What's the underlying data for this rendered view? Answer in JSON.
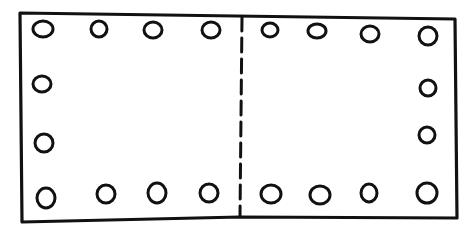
{
  "diagram": {
    "title": "",
    "stroke_color": "#111111",
    "background_color": "#ffffff",
    "outline": {
      "points": [
        [
          20,
          13
        ],
        [
          236,
          16
        ],
        [
          455,
          19
        ],
        [
          457,
          218
        ],
        [
          240,
          217
        ],
        [
          22,
          222
        ]
      ]
    },
    "fold_line": {
      "style": "dashed",
      "x1": 242,
      "y1": 17,
      "x2": 240,
      "y2": 216
    },
    "holes": [
      {
        "id": "top-1",
        "cx": 43,
        "cy": 29,
        "rx": 10,
        "ry": 8
      },
      {
        "id": "top-2",
        "cx": 99,
        "cy": 29,
        "rx": 8,
        "ry": 8
      },
      {
        "id": "top-3",
        "cx": 153,
        "cy": 30,
        "rx": 9,
        "ry": 8
      },
      {
        "id": "top-4",
        "cx": 211,
        "cy": 30,
        "rx": 9,
        "ry": 8
      },
      {
        "id": "top-5",
        "cx": 270,
        "cy": 30,
        "rx": 8,
        "ry": 7
      },
      {
        "id": "top-6",
        "cx": 317,
        "cy": 31,
        "rx": 9,
        "ry": 7
      },
      {
        "id": "top-7",
        "cx": 370,
        "cy": 34,
        "rx": 9,
        "ry": 8
      },
      {
        "id": "top-8",
        "cx": 428,
        "cy": 36,
        "rx": 9,
        "ry": 9
      },
      {
        "id": "left-1",
        "cx": 42,
        "cy": 84,
        "rx": 9,
        "ry": 8
      },
      {
        "id": "left-2",
        "cx": 44,
        "cy": 143,
        "rx": 9,
        "ry": 9
      },
      {
        "id": "right-1",
        "cx": 428,
        "cy": 88,
        "rx": 8,
        "ry": 8
      },
      {
        "id": "right-2",
        "cx": 427,
        "cy": 135,
        "rx": 8,
        "ry": 8
      },
      {
        "id": "bottom-1",
        "cx": 46,
        "cy": 198,
        "rx": 9,
        "ry": 10
      },
      {
        "id": "bottom-2",
        "cx": 106,
        "cy": 194,
        "rx": 9,
        "ry": 9
      },
      {
        "id": "bottom-3",
        "cx": 157,
        "cy": 193,
        "rx": 9,
        "ry": 10
      },
      {
        "id": "bottom-4",
        "cx": 209,
        "cy": 193,
        "rx": 9,
        "ry": 9
      },
      {
        "id": "bottom-5",
        "cx": 271,
        "cy": 194,
        "rx": 10,
        "ry": 9
      },
      {
        "id": "bottom-6",
        "cx": 320,
        "cy": 195,
        "rx": 10,
        "ry": 9
      },
      {
        "id": "bottom-7",
        "cx": 369,
        "cy": 193,
        "rx": 8,
        "ry": 9
      },
      {
        "id": "bottom-8",
        "cx": 427,
        "cy": 193,
        "rx": 10,
        "ry": 10
      }
    ],
    "counts": {
      "total_holes": 20,
      "top_row": 8,
      "bottom_row": 8,
      "left_side_middle": 2,
      "right_side_middle": 2
    }
  }
}
